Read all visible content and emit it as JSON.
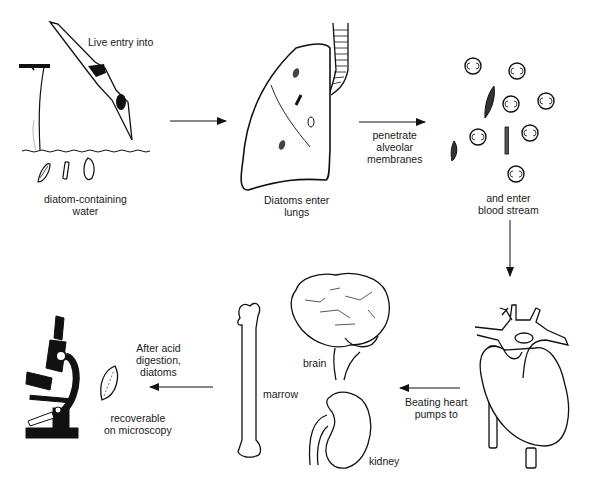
{
  "diagram": {
    "stages": [
      {
        "id": "entry",
        "label_lines": [
          "Live entry into"
        ]
      },
      {
        "id": "water",
        "label_lines": [
          "diatom-containing",
          "water"
        ]
      },
      {
        "id": "lungs",
        "label_lines": [
          "Diatoms enter",
          "lungs"
        ]
      },
      {
        "id": "membranes",
        "label_lines": [
          "penetrate",
          "alveolar",
          "membranes"
        ]
      },
      {
        "id": "blood",
        "label_lines": [
          "and enter",
          "blood stream"
        ]
      },
      {
        "id": "heart",
        "label_lines": [
          "Beating heart",
          "pumps to"
        ]
      },
      {
        "id": "brain",
        "label_lines": [
          "brain"
        ]
      },
      {
        "id": "marrow",
        "label_lines": [
          "marrow"
        ]
      },
      {
        "id": "kidney",
        "label_lines": [
          "kidney"
        ]
      },
      {
        "id": "digestion",
        "label_lines": [
          "After acid",
          "digestion,",
          "diatoms"
        ]
      },
      {
        "id": "microscopy",
        "label_lines": [
          "recoverable",
          "on microscopy"
        ]
      }
    ],
    "icons": [
      "diver-icon",
      "cliff-icon",
      "water-surface-icon",
      "diatom-icon",
      "lung-icon",
      "trachea-icon",
      "blood-cell-icon",
      "heart-icon",
      "brain-icon",
      "bone-icon",
      "kidney-icon",
      "microscope-icon",
      "arrow-icon"
    ],
    "colors": {
      "ink": "#111111",
      "background": "#ffffff"
    }
  }
}
